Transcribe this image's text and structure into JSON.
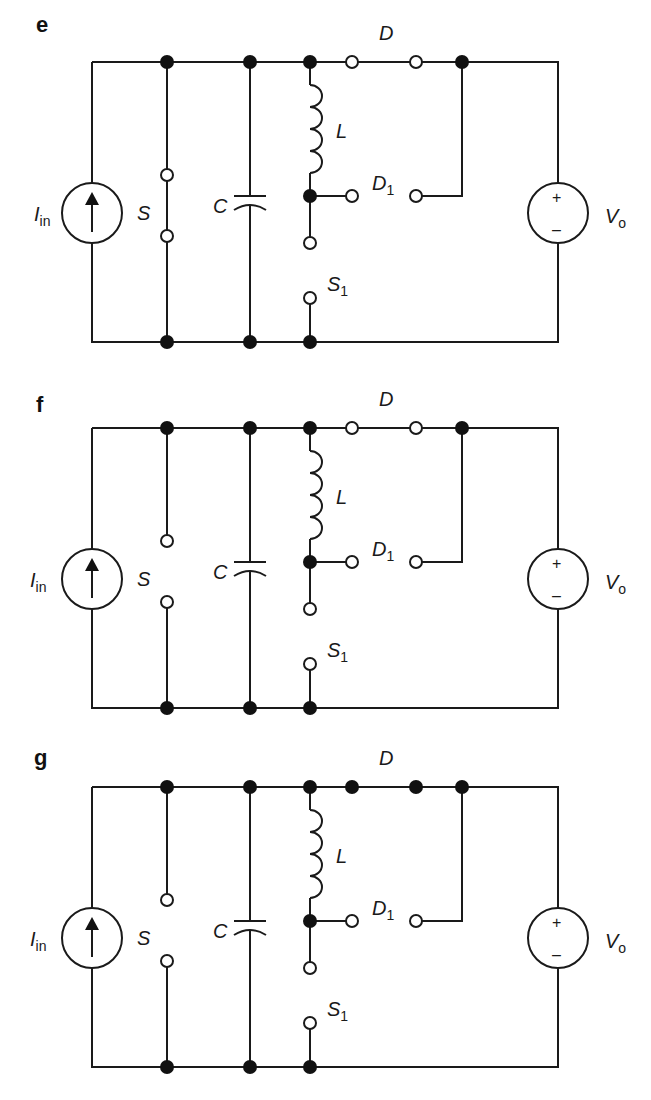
{
  "figure": {
    "labels": {
      "current_source": "I",
      "current_source_sub": "in",
      "switch": "S",
      "capacitor": "C",
      "inductor": "L",
      "diode": "D",
      "diode1": "D",
      "diode1_sub": "1",
      "switch1": "S",
      "switch1_sub": "1",
      "voltage_source": "V",
      "voltage_source_sub": "o",
      "plus": "+",
      "minus": "–"
    },
    "panels": [
      {
        "id": "e",
        "label": "e",
        "S_closed": true,
        "D_conducting": false,
        "D1_conducting": false,
        "S1_closed": false,
        "offset_y": 0
      },
      {
        "id": "f",
        "label": "f",
        "S_closed": false,
        "D_conducting": false,
        "D1_conducting": false,
        "S1_closed": false,
        "offset_y": 368
      },
      {
        "id": "g",
        "label": "g",
        "S_closed": false,
        "D_conducting": true,
        "D1_conducting": false,
        "S1_closed": false,
        "offset_y": 728
      }
    ]
  }
}
